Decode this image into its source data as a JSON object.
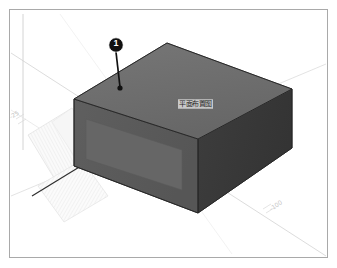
{
  "view": {
    "kind": "isometric-3d-model-view",
    "background_color": "#ffffff",
    "frame_color": "#a9a9a9"
  },
  "callout": {
    "number": "1",
    "marker_fill": "#111111",
    "marker_text_color": "#ffffff",
    "leader_color": "#111111"
  },
  "solid": {
    "top_face_color": "#6e6e6e",
    "left_face_color": "#5a5a5a",
    "left_panel_color": "#646464",
    "right_face_color": "#3a3a3a",
    "edge_color": "#2a2a2a",
    "face_label": "平面布置图"
  },
  "ground": {
    "grid_color": "#e4e4e4",
    "hatch_color": "#ededed",
    "axis_line_color": "#cfcfcf",
    "dimension_line_color": "#2f2f2f"
  },
  "axes": {
    "left_tick_label": "-25",
    "right_tick_label": "-100"
  }
}
